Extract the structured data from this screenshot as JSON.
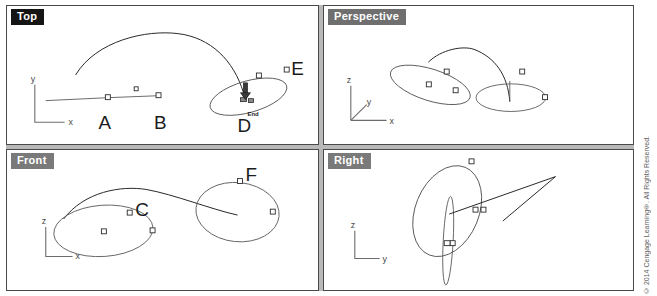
{
  "app": {
    "title": "CAD Four-Viewport Workspace",
    "copyright": "© 2014 Cengage Learning®. All Rights Reserved."
  },
  "viewports": [
    {
      "id": "top",
      "label": "Top",
      "axes": {
        "vertical": "y",
        "horizontal": "x"
      },
      "point_labels": [
        "A",
        "B",
        "D",
        "E"
      ],
      "osnap_tooltip": "End"
    },
    {
      "id": "perspective",
      "label": "Perspective",
      "axes": {
        "up": "z",
        "depth": "y",
        "right": "x"
      },
      "point_labels": []
    },
    {
      "id": "front",
      "label": "Front",
      "axes": {
        "vertical": "z",
        "horizontal": "x"
      },
      "point_labels": [
        "C",
        "F"
      ]
    },
    {
      "id": "right",
      "label": "Right",
      "axes": {
        "vertical": "z",
        "horizontal": "y"
      },
      "point_labels": []
    }
  ],
  "labels": {
    "top": {
      "a": "A",
      "b": "B",
      "d": "D",
      "e": "E",
      "osnap": "End",
      "axis_y": "y",
      "axis_x": "x"
    },
    "perspective": {
      "axis_z": "z",
      "axis_y": "y",
      "axis_x": "x"
    },
    "front": {
      "c": "C",
      "f": "F",
      "axis_z": "z",
      "axis_x": "x"
    },
    "right": {
      "axis_z": "z",
      "axis_y": "y"
    }
  },
  "colors": {
    "viewport_background": "#ffffff",
    "viewport_border": "#4a4a4a",
    "gutter": "#b9b9b9",
    "label_tab_dark": "#151515",
    "label_tab_gray": "#6f6f6f",
    "geometry": "#5a5a5a",
    "geometry_dark": "#262626",
    "grip": "#ffffff",
    "axis": "#6d6d6d",
    "point_label": "#1c1c1c",
    "copyright_text": "#5c5c5c"
  }
}
